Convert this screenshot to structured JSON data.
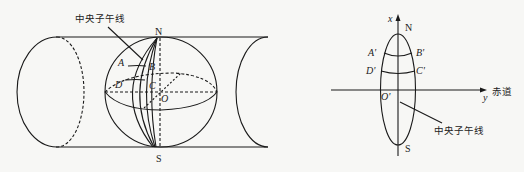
{
  "left_figure": {
    "title_label": "中央子午线",
    "north": "N",
    "south": "S",
    "points": {
      "A": "A",
      "B": "B",
      "C": "C",
      "D": "D",
      "O": "O"
    }
  },
  "right_figure": {
    "axis_x": "x",
    "axis_y": "y",
    "north": "N",
    "south": "S",
    "origin": "O'",
    "points": {
      "A": "A'",
      "B": "B'",
      "C": "C'",
      "D": "D'"
    },
    "equator_label": "赤道",
    "meridian_label": "中央子午线"
  },
  "colors": {
    "line": "#1a1a1a",
    "background": "#f7f7f5"
  }
}
